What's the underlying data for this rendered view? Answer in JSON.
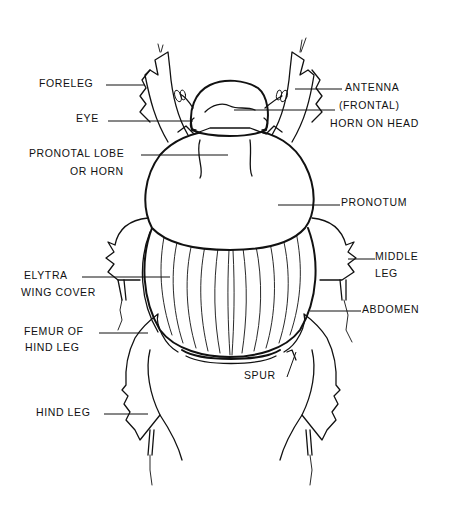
{
  "diagram": {
    "ink_color": "#111111",
    "background": "#ffffff",
    "labels": {
      "foreleg": "FORELEG",
      "eye": "EYE",
      "pronotal_lobe_1": "PRONOTAL LOBE",
      "pronotal_lobe_2": "OR HORN",
      "elytra_1": "ELYTRA",
      "elytra_2": "WING COVER",
      "femur_1": "FEMUR OF",
      "femur_2": "HIND LEG",
      "hind_leg": "HIND LEG",
      "antenna": "ANTENNA",
      "horn_1": "(FRONTAL)",
      "horn_2": "HORN ON HEAD",
      "pronotum": "PRONOTUM",
      "middle_leg_1": "MIDDLE",
      "middle_leg_2": "LEG",
      "abdomen": "ABDOMEN",
      "spur": "SPUR"
    }
  }
}
